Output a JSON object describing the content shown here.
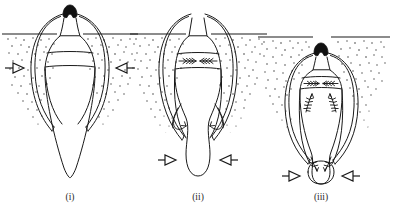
{
  "figure": {
    "background_color": "#ffffff",
    "ink_color": "#1a1a1a",
    "cap_color": "#111111",
    "soil_dot_color": "#3d3d3d",
    "width": 397,
    "height": 211
  },
  "panels": [
    {
      "id": "panel-i",
      "caption": "(i)",
      "caption_x": 70,
      "caption_y": 200,
      "center_x": 70,
      "ground_y": 34,
      "stage_name": "penetration",
      "description": "Elongate probe fully extended below ground line with two transverse bands and paired lateral flanges; no flow arrows present.",
      "bands": 2,
      "band_arrows": 0,
      "leg_arrows": 0,
      "markers": [
        {
          "name": "left-level-marker",
          "direction": "left",
          "x": 14,
          "y": 68
        },
        {
          "name": "right-level-marker",
          "direction": "right",
          "x": 126,
          "y": 68
        }
      ]
    },
    {
      "id": "panel-ii",
      "caption": "(ii)",
      "caption_x": 198,
      "caption_y": 200,
      "center_x": 198,
      "ground_y": 34,
      "stage_name": "contraction",
      "description": "Transverse band now carries two converging fletched arrows; curved recirculation arrows sweep inward at the base of each flange; distal end swollen into a bulb below ground.",
      "bands": 2,
      "band_arrows": 2,
      "leg_arrows": 2,
      "markers": [
        {
          "name": "left-level-marker",
          "direction": "left",
          "x": 166,
          "y": 160
        },
        {
          "name": "right-level-marker",
          "direction": "right",
          "x": 230,
          "y": 160
        }
      ]
    },
    {
      "id": "panel-iii",
      "caption": "(iii)",
      "caption_x": 321,
      "caption_y": 200,
      "center_x": 321,
      "ground_y": 37,
      "stage_name": "retraction",
      "description": "Body drawn up to the surface; converging fletched arrows in the band, branching feathered arrows along both inner legs, and converging arrows into the terminal bulb which now sits at the base.",
      "bands": 2,
      "band_arrows": 2,
      "leg_arrows": 2,
      "markers": [
        {
          "name": "left-level-marker",
          "direction": "left",
          "x": 290,
          "y": 176
        },
        {
          "name": "right-level-marker",
          "direction": "right",
          "x": 352,
          "y": 176
        }
      ]
    }
  ],
  "legend": {
    "marker_glyph": "triangle-with-tail",
    "arrow_glyph": "fletched-arrow",
    "soil_glyph": "stipple"
  }
}
